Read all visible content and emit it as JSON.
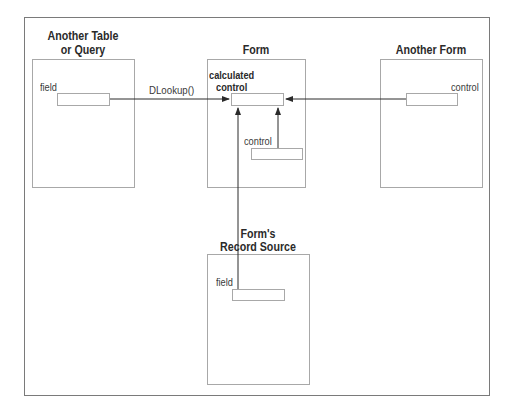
{
  "diagram": {
    "boxes": {
      "table": {
        "title_line1": "Another Table",
        "title_line2": "or Query",
        "field_label": "field"
      },
      "form": {
        "title": "Form",
        "calc_label_line1": "calculated",
        "calc_label_line2": "control",
        "control_label": "control"
      },
      "another_form": {
        "title": "Another Form",
        "control_label": "control"
      },
      "record_source": {
        "title_line1": "Form's",
        "title_line2": "Record Source",
        "field_label": "field"
      }
    },
    "connectors": [
      {
        "from": "Another Table or Query field",
        "to": "calculated control",
        "label": "DLookup()"
      },
      {
        "from": "Another Form control",
        "to": "calculated control",
        "label": ""
      },
      {
        "from": "Form control",
        "to": "calculated control",
        "label": ""
      },
      {
        "from": "Form's Record Source field",
        "to": "calculated control",
        "label": ""
      }
    ],
    "colors": {
      "line": "#2a2a2a",
      "box_border": "#a8a8a8",
      "frame": "#7a7a7a"
    }
  }
}
